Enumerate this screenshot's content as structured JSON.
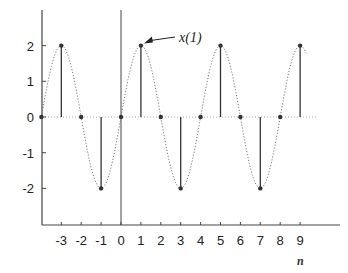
{
  "chart_data": {
    "type": "stem",
    "title": "",
    "xlabel": "n",
    "ylabel": "",
    "x": [
      -4,
      -3,
      -2,
      -1,
      0,
      1,
      2,
      3,
      4,
      5,
      6,
      7,
      8,
      9
    ],
    "values": [
      0,
      2,
      0,
      -2,
      0,
      2,
      0,
      -2,
      0,
      2,
      0,
      -2,
      0,
      2
    ],
    "envelope": "dotted sinusoid 2*sin(pi*n/2)",
    "x_tick_labels": [
      "-3",
      "-2",
      "-1",
      "0",
      "1",
      "2",
      "3",
      "4",
      "5",
      "6",
      "7",
      "8",
      "9"
    ],
    "y_tick_labels": [
      "2",
      "1",
      "0",
      "-1",
      "-2"
    ],
    "y_ticks": [
      2,
      1,
      0,
      -1,
      -2
    ],
    "ylim": [
      -3,
      3
    ],
    "xlim": [
      -4,
      11
    ],
    "grid": false,
    "legend": null,
    "annotations": [
      {
        "text": "x(1)",
        "points_to": {
          "n": 1,
          "value": 2
        }
      }
    ]
  },
  "colors": {
    "axis": "#444444",
    "stem": "#333333",
    "envelope": "#777777",
    "text": "#222222"
  }
}
